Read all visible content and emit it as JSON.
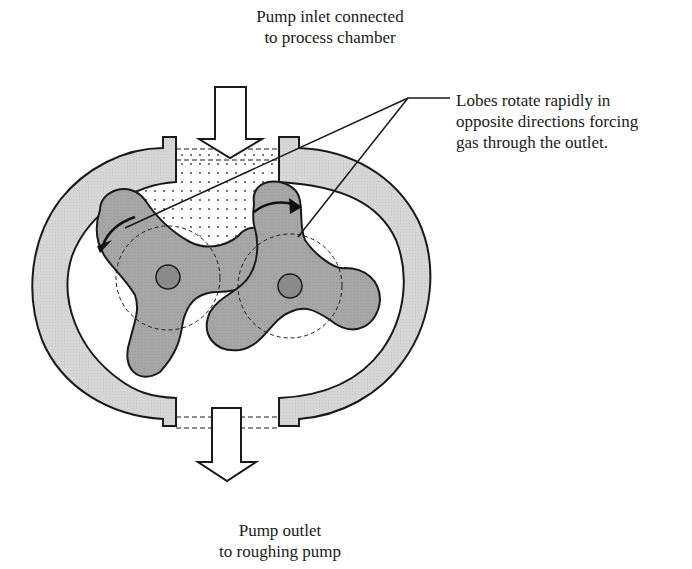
{
  "labels": {
    "inlet": {
      "line1": "Pump inlet connected",
      "line2": "to process chamber"
    },
    "outlet": {
      "line1": "Pump outlet",
      "line2": "to roughing pump"
    },
    "lobes": {
      "line1": "Lobes rotate rapidly in",
      "line2": "opposite directions forcing",
      "line3": "gas through the outlet."
    }
  },
  "colors": {
    "housing_fill": "#d4d4d4",
    "lobe_fill": "#a3a3a3",
    "shaft_fill": "#8a8a8a",
    "outline": "#1a1a1a",
    "background": "#ffffff"
  },
  "components": [
    "pump-housing",
    "left-lobe",
    "right-lobe",
    "inlet-arrow",
    "outlet-arrow",
    "gas-region"
  ]
}
